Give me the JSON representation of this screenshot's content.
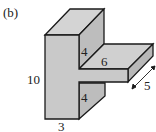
{
  "figure": {
    "panel_label": "(b)",
    "shape": "3D T-shaped prism (side view)",
    "colors": {
      "fill": "#c9c9c9",
      "stroke": "#1a1a1a",
      "text": "#222222"
    },
    "dimensions": {
      "height": "10",
      "width": "3",
      "upper_side": "4",
      "lower_side": "4",
      "arm_length": "6",
      "depth": "5"
    }
  }
}
